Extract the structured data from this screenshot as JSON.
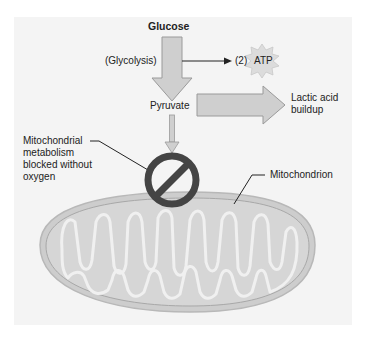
{
  "diagram": {
    "title": "Glucose",
    "labels": {
      "glycolysis": "(Glycolysis)",
      "atp_count": "(2)",
      "atp": "ATP",
      "pyruvate": "Pyruvate",
      "lactic_line1": "Lactic acid",
      "lactic_line2": "buildup",
      "blocked_line1": "Mitochondrial",
      "blocked_line2": "metabolism",
      "blocked_line3": "blocked without",
      "blocked_line4": "oxygen",
      "mitochondrion": "Mitochondrion"
    },
    "colors": {
      "panel_bg": "#f4f4f4",
      "arrow_fill": "#cfcfcf",
      "arrow_stroke": "#9a9a9a",
      "block_symbol": "#444444",
      "mito_fill": "#d2d2d2",
      "mito_inner": "#f0f0f0"
    }
  }
}
